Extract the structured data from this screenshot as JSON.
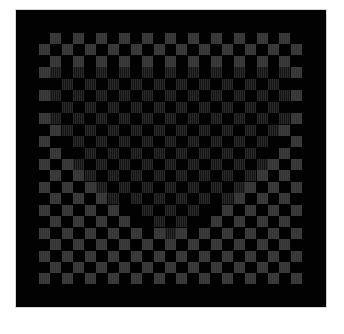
{
  "image": {
    "description": "Optical illusion: checkerboard of grey squares on black with a heart shape formed by dimmer, phase-shifted checker squares",
    "colors": {
      "background": "#ffffff",
      "frame": "#020202",
      "outer_square": "#3d3d3d",
      "heart_square": "#232323"
    },
    "grid": {
      "columns": 23,
      "rows": 22,
      "cell_pitch_px": 11.45
    }
  }
}
